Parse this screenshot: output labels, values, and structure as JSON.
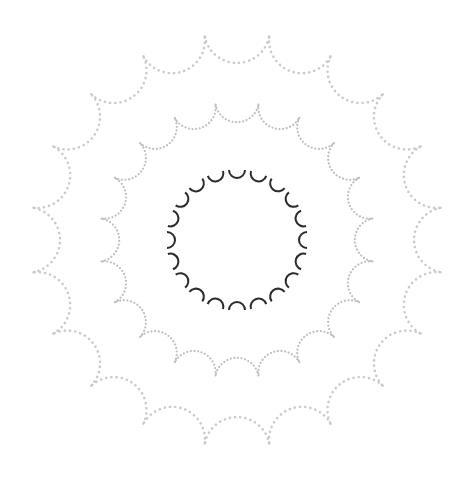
{
  "figure": {
    "center": [
      237,
      240
    ],
    "background": "#ffffff",
    "rings": [
      {
        "name": "outer-ring",
        "style": "dotted",
        "count": 20,
        "cusp_radius": 206,
        "color": "#c9c9c9",
        "dot_size": 2.6,
        "dot_gap": 5.2,
        "start_deg": -81
      },
      {
        "name": "middle-ring",
        "style": "dotted",
        "count": 20,
        "cusp_radius": 137,
        "color": "#bdbdbd",
        "dot_size": 2.2,
        "dot_gap": 3.6,
        "start_deg": -81
      },
      {
        "name": "inner-ring",
        "style": "solid-arcs",
        "count": 20,
        "arc_center_radius": 70,
        "arc_radius": 8,
        "color": "#2b2b2b",
        "stroke_width": 2,
        "start_deg": -90
      }
    ]
  }
}
